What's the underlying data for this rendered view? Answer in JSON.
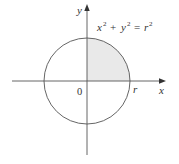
{
  "diagram": {
    "type": "circle-quadrant",
    "colors": {
      "stroke": "#555555",
      "axis": "#555555",
      "shade": "#e9e9e9",
      "text": "#333333"
    },
    "axes": {
      "x_label": "x",
      "y_label": "y",
      "origin_label": "0"
    },
    "circle": {
      "equation_parts": {
        "x": "x",
        "x_exp": "2",
        "plus": "+",
        "y": "y",
        "y_exp": "2",
        "equals": "=",
        "r": "r",
        "r_exp": "2"
      },
      "equation_text": "x² + y² = r²",
      "radius_label": "r"
    },
    "shaded_region": "first quadrant of circle (x ≥ 0, y ≥ 0)"
  }
}
